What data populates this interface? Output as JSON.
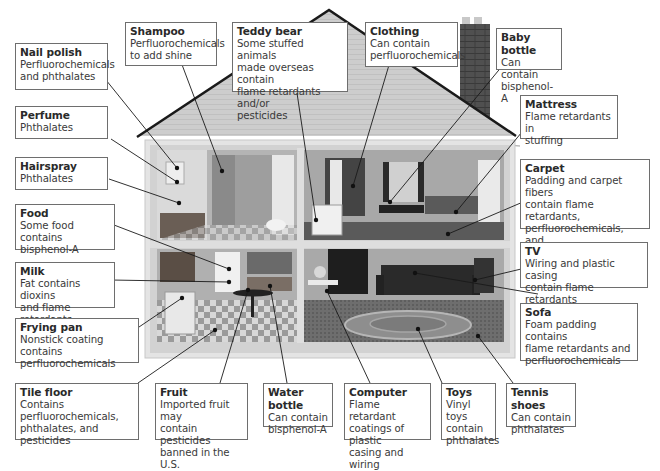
{
  "diagram": {
    "type": "labeled-illustration",
    "rooms": [
      "bathroom",
      "bedroom",
      "kitchen",
      "living room"
    ]
  },
  "callouts": [
    {
      "id": "nail-polish",
      "title": "Nail polish",
      "desc": "Perfluorochemicals\nand phthalates"
    },
    {
      "id": "shampoo",
      "title": "Shampoo",
      "desc": "Perfluorochemicals\nto add shine"
    },
    {
      "id": "teddy-bear",
      "title": "Teddy bear",
      "desc": "Some stuffed animals\nmade overseas contain\nflame retardants and/or\npesticides"
    },
    {
      "id": "clothing",
      "title": "Clothing",
      "desc": "Can contain\nperfluorochemicals"
    },
    {
      "id": "baby-bottle",
      "title": "Baby bottle",
      "desc": "Can contain\nbisphenol-A"
    },
    {
      "id": "perfume",
      "title": "Perfume",
      "desc": "Phthalates"
    },
    {
      "id": "hairspray",
      "title": "Hairspray",
      "desc": "Phthalates"
    },
    {
      "id": "mattress",
      "title": "Mattress",
      "desc": "Flame retardants in\nstuffing"
    },
    {
      "id": "carpet",
      "title": "Carpet",
      "desc": "Padding and carpet fibers\ncontain flame retardants,\nperfluorochemicals, and\npesticides"
    },
    {
      "id": "food",
      "title": "Food",
      "desc": "Some food contains\nbisphenol-A"
    },
    {
      "id": "milk",
      "title": "Milk",
      "desc": "Fat contains dioxins\nand flame retardants"
    },
    {
      "id": "tv",
      "title": "TV",
      "desc": "Wiring and plastic casing\ncontain flame retardants"
    },
    {
      "id": "frying-pan",
      "title": "Frying pan",
      "desc": "Nonstick coating contains\nperfluorochemicals"
    },
    {
      "id": "sofa",
      "title": "Sofa",
      "desc": "Foam padding contains\nflame retardants and\nperfluorochemicals"
    },
    {
      "id": "tile-floor",
      "title": "Tile floor",
      "desc": "Contains\nperfluorochemicals,\nphthalates, and pesticides"
    },
    {
      "id": "fruit",
      "title": "Fruit",
      "desc": "Imported fruit may\ncontain pesticides\nbanned in the U.S."
    },
    {
      "id": "water-bottle",
      "title": "Water bottle",
      "desc": "Can contain\nbisphenol-A"
    },
    {
      "id": "computer",
      "title": "Computer",
      "desc": "Flame retardant\ncoatings of plastic\ncasing and wiring"
    },
    {
      "id": "toys",
      "title": "Toys",
      "desc": "Vinyl toys\ncontain\nphthalates"
    },
    {
      "id": "tennis-shoes",
      "title": "Tennis shoes",
      "desc": "Can contain\nphthalates"
    }
  ],
  "colors": {
    "roof": "#c9c9c9",
    "roof_outline": "#1a1a1a",
    "wall": "#e3e3e3",
    "chimney": "#4a4a4a",
    "leader": "#1a1a1a",
    "box_border": "#6e6e6e"
  }
}
